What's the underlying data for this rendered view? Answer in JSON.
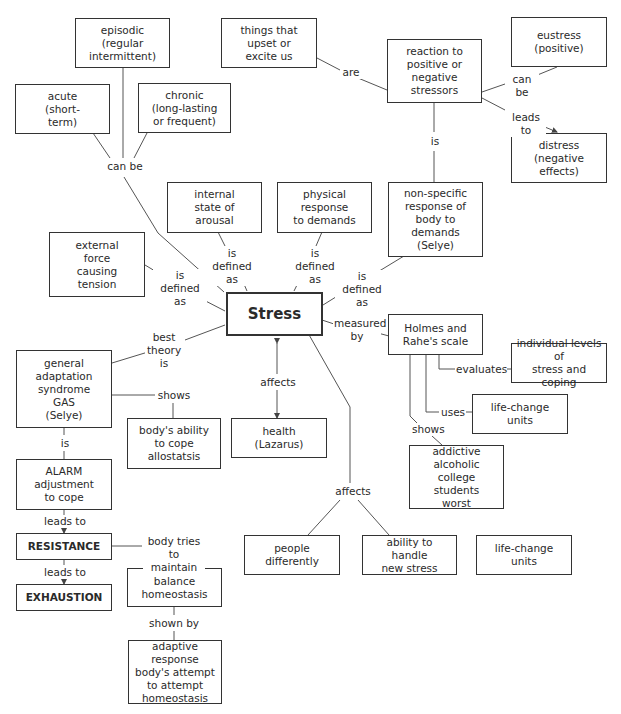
{
  "diagram": {
    "type": "concept-map",
    "central_concept": "Stress",
    "nodes": {
      "episodic": "episodic\n(regular\nintermittent)",
      "things": "things that\nupset or\nexcite us",
      "reaction": "reaction to\npositive or\nnegative\nstressors",
      "eustress": "eustress\n(positive)",
      "acute": "acute\n(short-\nterm)",
      "chronic": "chronic\n(long-lasting\nor frequent)",
      "distress": "distress\n(negative\neffects)",
      "internal": "internal\nstate of\narousal",
      "physical": "physical\nresponse\nto demands",
      "nonspecific": "non-specific\nresponse of\nbody to\ndemands\n(Selye)",
      "external": "external\nforce\ncausing\ntension",
      "stress": "Stress",
      "holmes": "Holmes and\nRahe's scale",
      "individual": "individual levels of\nstress and coping",
      "gas": "general\nadaptation\nsyndrome\nGAS\n(Selye)",
      "bodys_ability": "body's ability\nto cope\nallostatsis",
      "health": "health\n(Lazarus)",
      "lcu1": "life-change\nunits",
      "addictive": "addictive\nalcoholic\ncollege students\nworst",
      "alarm": "ALARM\nadjustment\nto cope",
      "resistance": "RESISTANCE",
      "exhaustion": "EXHAUSTION",
      "balance": "balance\nhomeostasis",
      "people": "people\ndifferently",
      "ability": "ability to handle\nnew stress",
      "lcu2": "life-change\nunits",
      "adaptive": "adaptive response\nbody's attempt\nto attempt\nhomeostasis"
    },
    "links": {
      "can_be_1": "can be",
      "are": "are",
      "can_be_2": "can be",
      "leads_to_1": "leads to",
      "is_1": "is",
      "def_internal": "is\ndefined as",
      "def_physical": "is\ndefined as",
      "def_external": "is\ndefined as",
      "def_nonspecific": "is\ndefined as",
      "measured_by": "measured\nby",
      "best_theory": "best\ntheory\nis",
      "shows_1": "shows",
      "affects_1": "affects",
      "evaluates": "evaluates",
      "uses": "uses",
      "shows_2": "shows",
      "is_2": "is",
      "leads_to_2": "leads to",
      "leads_to_3": "leads to",
      "body_tries": "body tries\nto maintain",
      "affects_2": "affects",
      "shown_by": "shown by"
    }
  }
}
